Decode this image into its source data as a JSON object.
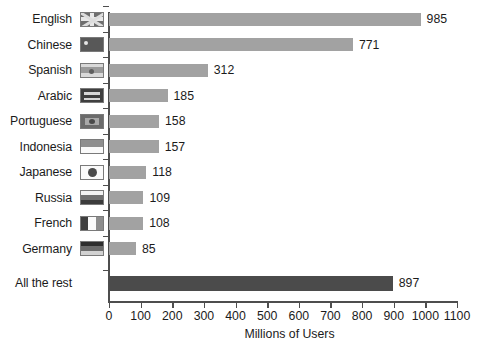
{
  "chart_data": {
    "type": "bar",
    "orientation": "horizontal",
    "title": "",
    "xlabel": "Millions of Users",
    "ylabel": "",
    "xlim": [
      0,
      1100
    ],
    "xticks": [
      0,
      100,
      200,
      300,
      400,
      500,
      600,
      700,
      800,
      900,
      1000,
      1100
    ],
    "grid": false,
    "legend": false,
    "categories": [
      "English",
      "Chinese",
      "Spanish",
      "Arabic",
      "Portuguese",
      "Indonesia",
      "Japanese",
      "Russia",
      "French",
      "Germany",
      "All the rest"
    ],
    "values": [
      985,
      771,
      312,
      185,
      158,
      157,
      118,
      109,
      108,
      85,
      897
    ],
    "bars": [
      {
        "label": "English",
        "value": 985,
        "value_text": "985",
        "flag": "flag-united-kingdom",
        "color": "#a2a2a2"
      },
      {
        "label": "Chinese",
        "value": 771,
        "value_text": "771",
        "flag": "flag-china",
        "color": "#a2a2a2"
      },
      {
        "label": "Spanish",
        "value": 312,
        "value_text": "312",
        "flag": "flag-spain",
        "color": "#a2a2a2"
      },
      {
        "label": "Arabic",
        "value": 185,
        "value_text": "185",
        "flag": "flag-saudi-arabia",
        "color": "#a2a2a2"
      },
      {
        "label": "Portuguese",
        "value": 158,
        "value_text": "158",
        "flag": "flag-brazil",
        "color": "#a2a2a2"
      },
      {
        "label": "Indonesia",
        "value": 157,
        "value_text": "157",
        "flag": "flag-indonesia",
        "color": "#a2a2a2"
      },
      {
        "label": "Japanese",
        "value": 118,
        "value_text": "118",
        "flag": "flag-japan",
        "color": "#a2a2a2"
      },
      {
        "label": "Russia",
        "value": 109,
        "value_text": "109",
        "flag": "flag-russia",
        "color": "#a2a2a2"
      },
      {
        "label": "French",
        "value": 108,
        "value_text": "108",
        "flag": "flag-france",
        "color": "#a2a2a2"
      },
      {
        "label": "Germany",
        "value": 85,
        "value_text": "85",
        "flag": "flag-germany",
        "color": "#a2a2a2"
      },
      {
        "label": "All the rest",
        "value": 897,
        "value_text": "897",
        "flag": null,
        "color": "#4b4b4b"
      }
    ],
    "colors": {
      "bar": "#a2a2a2",
      "bar_highlight": "#4b4b4b",
      "axis": "#4e4e4e",
      "text": "#1b1b1b",
      "background": "#ffffff"
    }
  }
}
